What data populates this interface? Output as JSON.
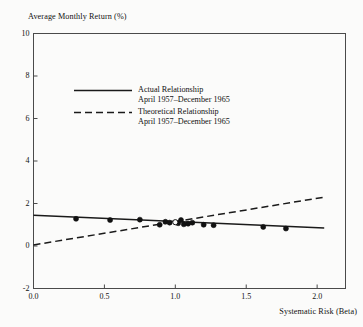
{
  "chart_data": {
    "type": "scatter",
    "title": "",
    "xlabel": "Systematic Risk (Beta)",
    "ylabel": "Average Monthly Return (%)",
    "xlim": [
      0.0,
      2.2
    ],
    "ylim": [
      -2,
      10
    ],
    "grid": false,
    "xticks": [
      "0.0",
      "0.5",
      "1.0",
      "1.5",
      "2.0"
    ],
    "xtick_values": [
      0.0,
      0.5,
      1.0,
      1.5,
      2.0
    ],
    "yticks": [
      "10",
      "8",
      "6",
      "4",
      "2",
      "0",
      "-2"
    ],
    "ytick_values": [
      10,
      8,
      6,
      4,
      2,
      0,
      -2
    ],
    "legend_position": "upper-left-inside",
    "legend": [
      {
        "style": "solid",
        "label_line1": "Actual Relationship",
        "label_line2": "April 1957–December 1965"
      },
      {
        "style": "dashed",
        "label_line1": "Theoretical Relationship",
        "label_line2": "April 1957–December 1965"
      }
    ],
    "series": [
      {
        "name": "Actual Relationship",
        "type": "line",
        "style": "solid",
        "points": [
          [
            0.0,
            1.45
          ],
          [
            2.05,
            0.85
          ]
        ]
      },
      {
        "name": "Theoretical Relationship",
        "type": "line",
        "style": "dashed",
        "points": [
          [
            0.0,
            0.05
          ],
          [
            2.05,
            2.3
          ]
        ]
      },
      {
        "name": "Portfolio observations",
        "type": "scatter",
        "marker": "filled-circle",
        "x": [
          0.3,
          0.54,
          0.75,
          0.89,
          0.93,
          0.96,
          1.02,
          1.04,
          1.06,
          1.09,
          1.12,
          1.2,
          1.27,
          1.62,
          1.78
        ],
        "y": [
          1.28,
          1.22,
          1.24,
          1.0,
          1.14,
          1.1,
          1.07,
          1.22,
          1.02,
          1.05,
          1.1,
          1.0,
          0.98,
          0.9,
          0.82
        ]
      },
      {
        "name": "Market portfolio",
        "type": "scatter",
        "marker": "open-circle",
        "x": [
          1.0
        ],
        "y": [
          1.12
        ]
      }
    ]
  },
  "colors": {
    "background": "#fbfbfa",
    "axis": "#4a4a4a",
    "line": "#1a1a1a",
    "marker": "#111111",
    "text": "#111111"
  }
}
